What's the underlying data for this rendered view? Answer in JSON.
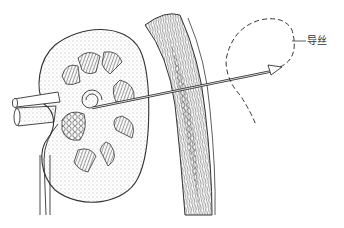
{
  "figure": {
    "type": "medical-illustration",
    "labels": [
      {
        "id": "guidewire",
        "text": "导丝",
        "x": 303,
        "y": 37
      }
    ],
    "colors": {
      "ink": "#333333",
      "background": "#ffffff"
    }
  }
}
